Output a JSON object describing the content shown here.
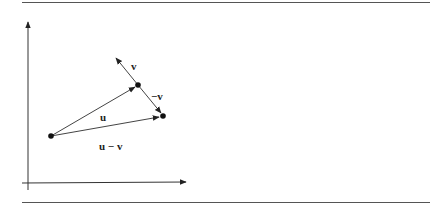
{
  "figure": {
    "type": "vector-subtraction-diagram",
    "colors": {
      "ink": "#222222",
      "vector": "#444444",
      "axis": "#333333",
      "rule": "#555555"
    },
    "axes": {
      "origin": [
        27,
        183
      ],
      "x_end": [
        187,
        182
      ],
      "y_end": [
        28,
        21
      ]
    },
    "points": {
      "tail": [
        51,
        136
      ],
      "u_tip": [
        138,
        85
      ],
      "u_minus_v_tip": [
        163,
        116
      ]
    },
    "vectors": [
      {
        "id": "u",
        "label": "u",
        "from": [
          51,
          136
        ],
        "to": [
          138,
          85
        ]
      },
      {
        "id": "v",
        "label": "v",
        "from": [
          138,
          85
        ],
        "to": [
          115,
          57
        ]
      },
      {
        "id": "neg_v",
        "label": "−v",
        "from": [
          138,
          85
        ],
        "to": [
          163,
          116
        ]
      },
      {
        "id": "u_minus_v",
        "label": "u − v",
        "from": [
          51,
          136
        ],
        "to": [
          163,
          116
        ]
      }
    ],
    "labels": {
      "v": "v",
      "neg_v": "−v",
      "u": "u",
      "u_minus_v": "u − v"
    }
  }
}
